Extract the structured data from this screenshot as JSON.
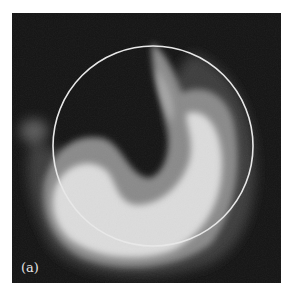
{
  "figure": {
    "panel_label": "(a)",
    "colors": {
      "background": "#141414",
      "bright_region": "#dcdcdc",
      "mid_region": "#8a8a8a",
      "circle_outline": "#e8e8e8"
    },
    "circle": {
      "cx": 141,
      "cy": 133,
      "r": 100
    }
  }
}
